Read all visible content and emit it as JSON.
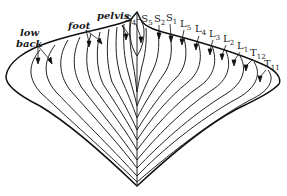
{
  "diagram": {
    "type": "dermatome map (sacral/lumbar/thoracic segments)",
    "region_labels": [
      {
        "id": "low-back",
        "text": "low back"
      },
      {
        "id": "foot",
        "text": "foot"
      },
      {
        "id": "pelvis",
        "text": "pelvis"
      }
    ],
    "segment_labels": [
      {
        "id": "s4-s5",
        "main": "S",
        "sub": "4",
        "rest": "–S",
        "sub2": "5"
      },
      {
        "id": "s2",
        "main": "S",
        "sub": "2"
      },
      {
        "id": "s1",
        "main": "S",
        "sub": "1"
      },
      {
        "id": "l5",
        "main": "L",
        "sub": "5"
      },
      {
        "id": "l4",
        "main": "L",
        "sub": "4"
      },
      {
        "id": "l3",
        "main": "L",
        "sub": "3"
      },
      {
        "id": "l2",
        "main": "L",
        "sub": "2"
      },
      {
        "id": "l1",
        "main": "L",
        "sub": "1"
      },
      {
        "id": "t12",
        "main": "T",
        "sub": "12"
      },
      {
        "id": "t11",
        "main": "T",
        "sub": "11"
      }
    ],
    "colors": {
      "line": "#222222",
      "background": "#ffffff"
    }
  }
}
